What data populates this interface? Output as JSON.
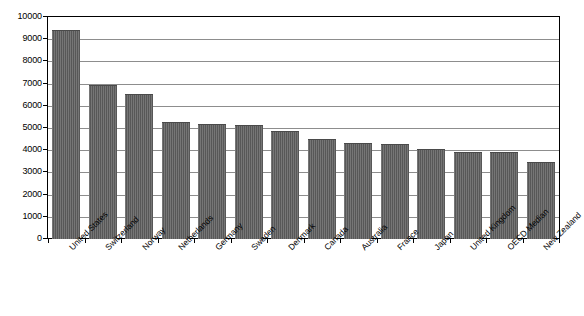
{
  "chart_data": {
    "type": "bar",
    "title": "",
    "subtitle": "",
    "xlabel": "",
    "ylabel": "",
    "ylim": [
      0,
      10000
    ],
    "ytick_step": 1000,
    "grid": true,
    "legend": false,
    "bar_color": "#5c5c5c",
    "axis_color": "#000000",
    "gridline_color": "#8d8d8d",
    "categories": [
      "United States",
      "Switzerland",
      "Norway",
      "Netherlands",
      "Germany",
      "Sweden",
      "Denmark",
      "Canada",
      "Australia",
      "France",
      "Japan",
      "United Kingdom",
      "OECD Median",
      "New Zealand"
    ],
    "values": [
      9400,
      6950,
      6540,
      5280,
      5200,
      5150,
      4870,
      4520,
      4320,
      4300,
      4060,
      3920,
      3900,
      3450
    ],
    "ytick_labels": [
      "0",
      "1000",
      "2000",
      "3000",
      "4000",
      "5000",
      "6000",
      "7000",
      "8000",
      "9000",
      "10000"
    ]
  }
}
